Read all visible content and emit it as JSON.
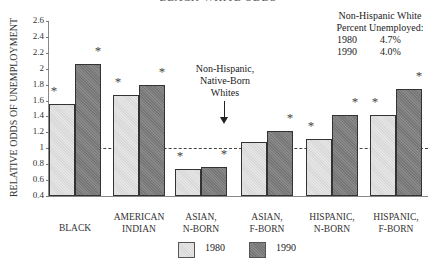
{
  "chart_data": {
    "type": "bar",
    "title": "",
    "xlabel": "",
    "ylabel": "RELATIVE ODDS OF UNEMPLOYMENT",
    "ylim": [
      0.4,
      2.6
    ],
    "yticks": [
      "2.6",
      "2.4",
      "2.2",
      "2",
      "1.8",
      "1.6",
      "1.4",
      "1.2",
      "1",
      "0.8",
      "0.6",
      "0.4"
    ],
    "grid": false,
    "legend_position": "bottom",
    "categories": [
      [
        "BLACK"
      ],
      [
        "AMERICAN",
        "INDIAN"
      ],
      [
        "ASIAN,",
        "N-BORN"
      ],
      [
        "ASIAN,",
        "F-BORN"
      ],
      [
        "HISPANIC,",
        "N-BORN"
      ],
      [
        "HISPANIC,",
        "F-BORN"
      ]
    ],
    "series": [
      {
        "name": "1980",
        "color": "#d8d8d8",
        "values": [
          1.56,
          1.67,
          0.74,
          1.08,
          1.12,
          1.42
        ],
        "significant": [
          true,
          true,
          true,
          false,
          true,
          true
        ]
      },
      {
        "name": "1990",
        "color": "#8a8a8a",
        "values": [
          2.06,
          1.8,
          0.77,
          1.22,
          1.42,
          1.75
        ],
        "significant": [
          true,
          true,
          true,
          true,
          true,
          true
        ]
      }
    ],
    "reference_line": {
      "value": 1,
      "style": "dashed"
    },
    "annotations": {
      "reference_label": [
        "Non-Hispanic,",
        "Native-Born",
        "Whites"
      ],
      "white_box": {
        "heading": [
          "Non-Hispanic White",
          "Percent Unemployed:"
        ],
        "rows": [
          [
            "1980",
            "4.7%"
          ],
          [
            "1990",
            "4.0%"
          ]
        ]
      },
      "significance_marker": "*"
    },
    "cut_title": "BLACK-WHITE ODDS"
  }
}
